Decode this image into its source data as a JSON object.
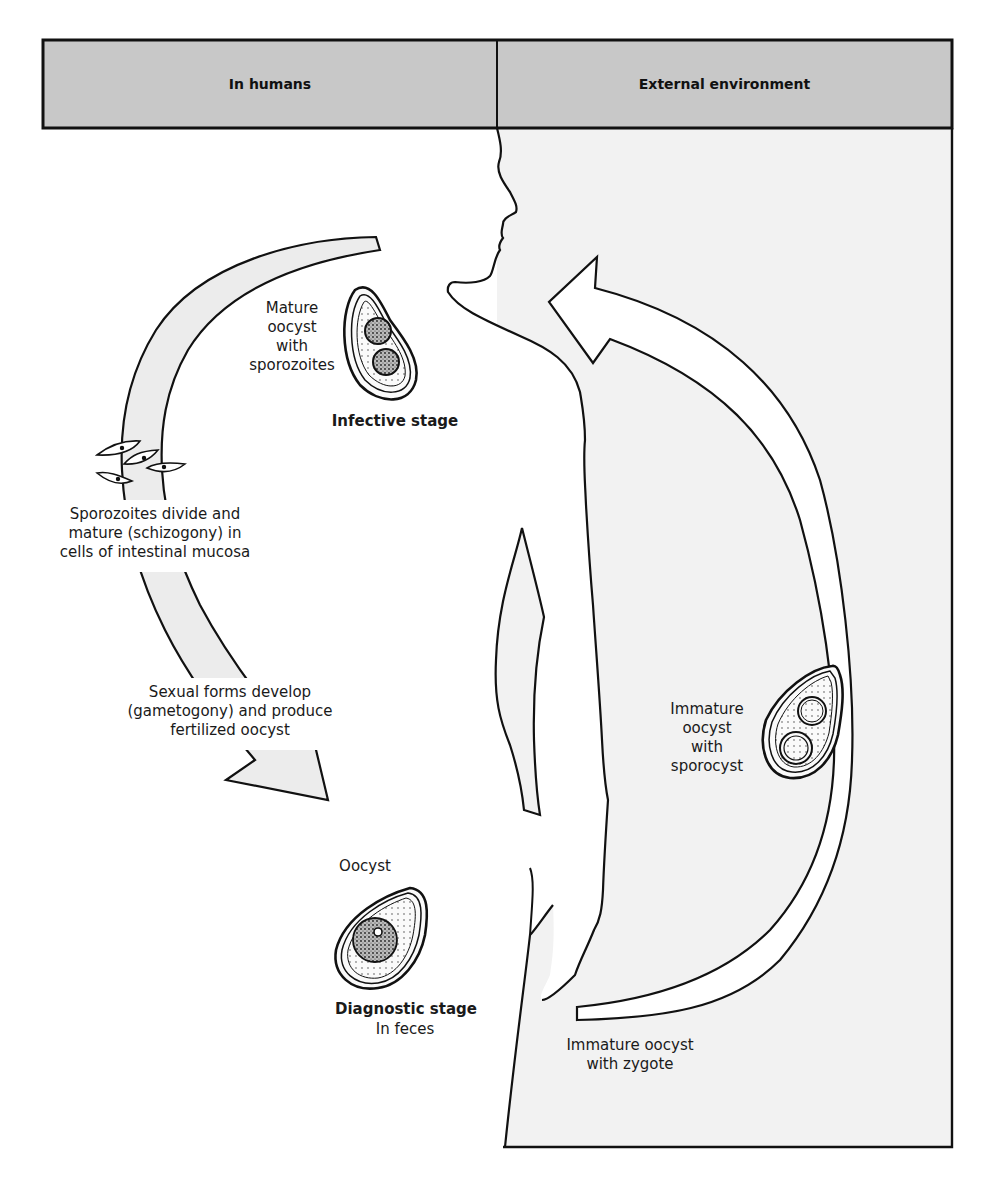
{
  "header": {
    "left_label": "In humans",
    "right_label": "External environment",
    "fill_color": "#c8c8c8"
  },
  "colors": {
    "background": "#ffffff",
    "environment_fill": "#f2f2f2",
    "arrow_fill_humans": "#ececec",
    "arrow_fill_environment": "#ffffff",
    "outline": "#111111"
  },
  "stages": {
    "infective": {
      "description_lines": [
        "Mature",
        "oocyst",
        "with",
        "sporozoites"
      ],
      "stage_label": "Infective stage"
    },
    "schizogony": {
      "lines": [
        "Sporozoites divide and",
        "mature (schizogony) in",
        "cells of intestinal mucosa"
      ]
    },
    "gametogony": {
      "lines": [
        "Sexual forms develop",
        "(gametogony) and produce",
        "fertilized oocyst"
      ]
    },
    "diagnostic": {
      "oocyst_label": "Oocyst",
      "stage_label": "Diagnostic stage",
      "sub_label": "In feces"
    },
    "immature_sporocyst": {
      "lines": [
        "Immature",
        "oocyst",
        "with",
        "sporocyst"
      ]
    },
    "immature_zygote": {
      "lines": [
        "Immature oocyst",
        "with zygote"
      ]
    }
  }
}
